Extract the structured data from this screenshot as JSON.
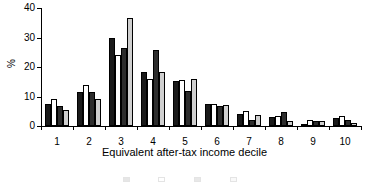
{
  "chart_data": {
    "type": "bar",
    "title": "",
    "xlabel": "Equivalent after-tax income decile",
    "ylabel": "%",
    "categories": [
      "1",
      "2",
      "3",
      "4",
      "5",
      "6",
      "7",
      "8",
      "9",
      "10"
    ],
    "ylim": [
      0,
      40
    ],
    "yticks": [
      0,
      10,
      20,
      30,
      40
    ],
    "ytick_labels": [
      "0",
      "10",
      "20",
      "30",
      "40"
    ],
    "grid": false,
    "legend_position": "bottom",
    "legend_visible": false,
    "series": [
      {
        "name": "series-1",
        "color": "#1a1a1a",
        "fill": "black",
        "values": [
          7.5,
          11.6,
          29.7,
          18.4,
          15.4,
          7.3,
          4.1,
          3.1,
          0.4,
          2.6
        ]
      },
      {
        "name": "series-2",
        "color": "#ffffff",
        "fill": "white",
        "values": [
          9.1,
          13.9,
          24.1,
          15.9,
          15.5,
          7.5,
          5.1,
          3.4,
          1.9,
          3.3
        ]
      },
      {
        "name": "series-3",
        "color": "#2d2d2d",
        "fill": "dark-grey",
        "values": [
          6.9,
          11.4,
          26.6,
          25.8,
          11.8,
          6.9,
          2.1,
          4.9,
          1.6,
          2.2
        ]
      },
      {
        "name": "series-4",
        "color": "#cfcfcf",
        "fill": "light-grey",
        "values": [
          5.4,
          9.3,
          36.7,
          18.4,
          16.0,
          7.0,
          3.8,
          1.6,
          1.6,
          1.0
        ]
      }
    ]
  },
  "axis": {
    "y_title": "%",
    "x_title": "Equivalent after-tax income decile"
  },
  "legend": {
    "truncated": true,
    "items": [
      {
        "label": "",
        "color": "#1a1a1a"
      },
      {
        "label": "",
        "color": "#ffffff"
      },
      {
        "label": "",
        "color": "#2d2d2d"
      },
      {
        "label": "",
        "color": "#cfcfcf"
      }
    ]
  }
}
